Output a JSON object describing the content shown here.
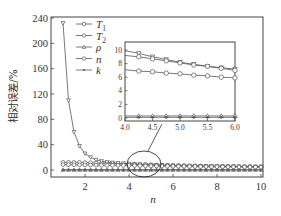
{
  "chart_data": [
    {
      "type": "line",
      "title": "",
      "xlabel": "n",
      "ylabel": "相对误差/%",
      "xlim": [
        0.45,
        10.1
      ],
      "ylim": [
        -11,
        242
      ],
      "xticks": [
        2,
        4,
        6,
        8,
        10
      ],
      "yticks": [
        0,
        40,
        80,
        120,
        160,
        200,
        240
      ],
      "grid": false,
      "legend_position": "upper-left",
      "x": [
        1,
        1.25,
        1.5,
        1.75,
        2,
        2.25,
        2.5,
        2.75,
        3,
        3.25,
        3.5,
        3.75,
        4,
        4.25,
        4.5,
        4.75,
        5,
        5.25,
        5.5,
        5.75,
        6,
        6.25,
        6.5,
        6.75,
        7,
        7.25,
        7.5,
        7.75,
        8,
        8.25,
        8.5,
        8.75,
        9,
        9.25,
        9.5,
        9.75,
        10
      ],
      "series": [
        {
          "name": "T1",
          "label_main": "T",
          "label_sub": "1",
          "marker": "circle",
          "values": [
            12,
            12,
            12,
            12,
            11.8,
            11.5,
            11.2,
            10.9,
            10.6,
            10.2,
            9.9,
            9.5,
            9.2,
            9.0,
            8.7,
            8.4,
            8.1,
            7.8,
            7.6,
            7.3,
            7.0,
            6.8,
            6.6,
            6.4,
            6.3,
            6.1,
            6.0,
            5.9,
            5.8,
            5.7,
            5.6,
            5.5,
            5.4,
            5.3,
            5.2,
            5.1,
            5.0
          ]
        },
        {
          "name": "T2",
          "label_main": "T",
          "label_sub": "2",
          "marker": "triangle-down",
          "values": [
            232,
            110,
            60,
            38,
            26,
            20,
            16,
            14,
            12.5,
            11.6,
            10.9,
            10.4,
            9.9,
            9.5,
            9.0,
            8.6,
            8.2,
            7.9,
            7.6,
            7.4,
            7.2,
            7.0,
            6.8,
            6.6,
            6.5,
            6.3,
            6.2,
            6.1,
            6.0,
            5.9,
            5.8,
            5.7,
            5.6,
            5.5,
            5.4,
            5.3,
            5.2
          ]
        },
        {
          "name": "ρ",
          "label_main": "ρ",
          "label_sub": "",
          "marker": "triangle-up",
          "values": [
            0.3,
            0.3,
            0.3,
            0.3,
            0.3,
            0.3,
            0.3,
            0.3,
            0.3,
            0.3,
            0.3,
            0.3,
            0.3,
            0.3,
            0.3,
            0.3,
            0.3,
            0.3,
            0.3,
            0.3,
            0.3,
            0.3,
            0.3,
            0.3,
            0.3,
            0.3,
            0.3,
            0.3,
            0.3,
            0.3,
            0.3,
            0.3,
            0.3,
            0.3,
            0.3,
            0.3,
            0.3
          ]
        },
        {
          "name": "n",
          "label_main": "n",
          "label_sub": "",
          "marker": "circle",
          "values": [
            8.5,
            8.4,
            8.3,
            8.2,
            8.1,
            7.9,
            7.8,
            7.6,
            7.5,
            7.4,
            7.3,
            7.2,
            7.1,
            6.9,
            6.8,
            6.6,
            6.5,
            6.3,
            6.2,
            6.0,
            5.9,
            5.8,
            5.7,
            5.6,
            5.5,
            5.4,
            5.3,
            5.2,
            5.1,
            5.0,
            4.9,
            4.9,
            4.8,
            4.7,
            4.6,
            4.6,
            4.5
          ]
        },
        {
          "name": "k",
          "label_main": "k",
          "label_sub": "",
          "marker": "star",
          "values": [
            0.1,
            0.1,
            0.1,
            0.1,
            0.1,
            0.1,
            0.1,
            0.1,
            0.1,
            0.1,
            0.1,
            0.1,
            0.1,
            0.1,
            0.1,
            0.1,
            0.1,
            0.1,
            0.1,
            0.1,
            0.1,
            0.1,
            0.1,
            0.1,
            0.1,
            0.1,
            0.1,
            0.1,
            0.1,
            0.1,
            0.1,
            0.1,
            0.1,
            0.1,
            0.1,
            0.1,
            0.1
          ]
        }
      ]
    },
    {
      "type": "line",
      "title": "inset (zoom of n = 4.0–6.0)",
      "xlabel": "",
      "ylabel": "",
      "xlim": [
        4.0,
        6.0
      ],
      "ylim": [
        -0.5,
        11
      ],
      "xticks": [
        4.0,
        4.5,
        5.0,
        5.5,
        6.0
      ],
      "xtick_labels": [
        "4.0",
        "4.5",
        "5.0",
        "5.5",
        "6.0"
      ],
      "yticks": [
        0,
        2,
        4,
        6,
        8,
        10
      ],
      "x": [
        4.0,
        4.25,
        4.5,
        4.75,
        5.0,
        5.25,
        5.5,
        5.75,
        6.0
      ],
      "series": [
        {
          "name": "T2",
          "marker": "triangle-down",
          "values": [
            9.9,
            9.5,
            9.0,
            8.6,
            8.2,
            7.9,
            7.6,
            7.4,
            7.2
          ]
        },
        {
          "name": "T1",
          "marker": "circle",
          "values": [
            9.2,
            9.0,
            8.7,
            8.4,
            8.1,
            7.8,
            7.6,
            7.3,
            7.0
          ]
        },
        {
          "name": "n",
          "marker": "circle",
          "values": [
            7.1,
            6.9,
            6.8,
            6.6,
            6.5,
            6.3,
            6.2,
            6.0,
            5.9
          ]
        },
        {
          "name": "ρ",
          "marker": "triangle-up",
          "values": [
            0.3,
            0.3,
            0.3,
            0.3,
            0.3,
            0.3,
            0.3,
            0.3,
            0.3
          ]
        },
        {
          "name": "k",
          "marker": "star",
          "values": [
            0.1,
            0.1,
            0.1,
            0.1,
            0.1,
            0.1,
            0.1,
            0.1,
            0.1
          ]
        }
      ]
    }
  ],
  "annotation": {
    "type": "ellipse-with-pointer",
    "description": "ellipse around n≈4–5 region linked to inset"
  },
  "colors": {
    "line": "#555555",
    "axis": "#444444",
    "background": "#ffffff"
  }
}
